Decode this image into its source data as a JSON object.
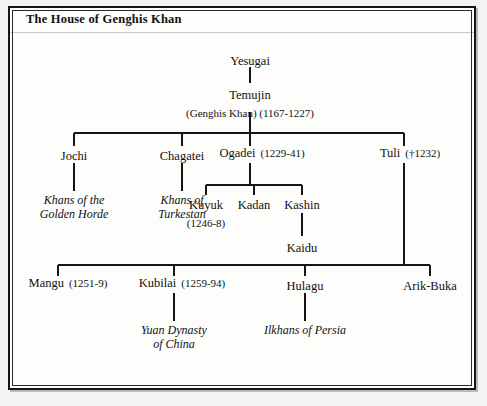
{
  "figure": {
    "title": "The House of Genghis Khan",
    "ink_color": "#16161a",
    "paper_color": "#fdfdfc"
  },
  "tree": {
    "generation_1": {
      "yesugai": {
        "name": "Yesugai"
      }
    },
    "generation_2": {
      "temujin": {
        "name": "Temujin",
        "alias_and_dates": "(Genghis Khan) (1167-1227)"
      }
    },
    "generation_3": {
      "jochi": {
        "name": "Jochi",
        "dates": ""
      },
      "chagatei": {
        "name": "Chagatei",
        "dates": ""
      },
      "ogadei": {
        "name": "Ogadei",
        "dates": "(1229-41)"
      },
      "tuli": {
        "name": "Tuli",
        "dates": "(†1232)"
      }
    },
    "generation_4": {
      "golden_horde": {
        "line1": "Khans of the",
        "line2": "Golden Horde"
      },
      "turkestan": {
        "line1": "Khans of",
        "line2": "Turkestan"
      },
      "kuyuk": {
        "name": "Kuyuk",
        "dates": "(1246-8)"
      },
      "kadan": {
        "name": "Kadan",
        "dates": ""
      },
      "kashin": {
        "name": "Kashin",
        "dates": ""
      }
    },
    "generation_5": {
      "kaidu": {
        "name": "Kaidu"
      }
    },
    "generation_6": {
      "mangu": {
        "name": "Mangu",
        "dates": "(1251-9)"
      },
      "kubilai": {
        "name": "Kubilai",
        "dates": "(1259-94)"
      },
      "hulagu": {
        "name": "Hulagu",
        "dates": ""
      },
      "arik_buka": {
        "name": "Arik-Buka",
        "dates": ""
      }
    },
    "generation_7": {
      "yuan_dynasty": {
        "line1": "Yuan Dynasty",
        "line2": "of China"
      },
      "ilkhans": {
        "line1": "Ilkhans of Persia",
        "line2": ""
      }
    }
  }
}
